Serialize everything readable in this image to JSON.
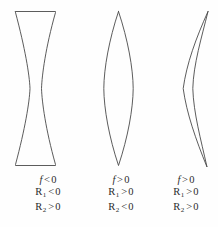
{
  "figure": {
    "background_color": "#fefefe",
    "stroke_color": "#4a4a4a",
    "text_color": "#2b2b2b"
  },
  "lenses": [
    {
      "name": "biconcave-lens",
      "shape": "biconcave",
      "caption": {
        "focal": {
          "symbol": "f",
          "relation": "<",
          "value": "0"
        },
        "r1": {
          "symbol": "R",
          "subscript": "1",
          "relation": "<",
          "value": "0"
        },
        "r2": {
          "symbol": "R",
          "subscript": "2",
          "relation": ">",
          "value": "0"
        }
      }
    },
    {
      "name": "biconvex-lens",
      "shape": "biconvex",
      "caption": {
        "focal": {
          "symbol": "f",
          "relation": ">",
          "value": "0"
        },
        "r1": {
          "symbol": "R",
          "subscript": "1",
          "relation": ">",
          "value": "0"
        },
        "r2": {
          "symbol": "R",
          "subscript": "2",
          "relation": "<",
          "value": "0"
        }
      }
    },
    {
      "name": "meniscus-lens",
      "shape": "meniscus",
      "caption": {
        "focal": {
          "symbol": "f",
          "relation": ">",
          "value": "0"
        },
        "r1": {
          "symbol": "R",
          "subscript": "1",
          "relation": ">",
          "value": "0"
        },
        "r2": {
          "symbol": "R",
          "subscript": "2",
          "relation": ">",
          "value": "0"
        }
      }
    }
  ]
}
